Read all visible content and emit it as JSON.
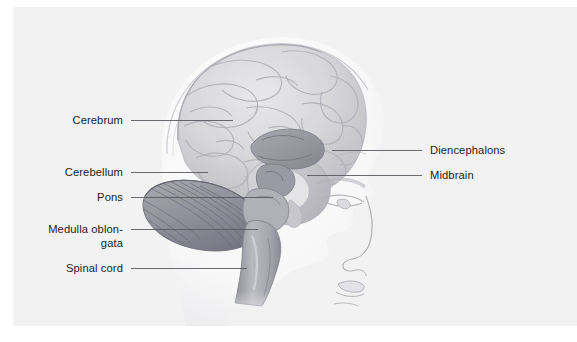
{
  "figure": {
    "subject": "brain",
    "view": "lateral-sagittal-profile",
    "panel_background": "#f2f2f2",
    "page_background": "#ffffff",
    "leader_line_color": "#5a5a62",
    "label_text_color": "#1d1d1d"
  },
  "labels": {
    "left": [
      {
        "id": "cerebrum",
        "text": "Cerebrum",
        "text_x": 123,
        "text_y": 113,
        "line_y": 120,
        "line_x1": 131,
        "line_x2": 233
      },
      {
        "id": "cerebellum",
        "text": "Cerebellum",
        "text_x": 123,
        "text_y": 165,
        "line_y": 172,
        "line_x1": 131,
        "line_x2": 208
      },
      {
        "id": "pons",
        "text": "Pons",
        "text_x": 123,
        "text_y": 190,
        "line_y": 197,
        "line_x1": 131,
        "line_x2": 273
      },
      {
        "id": "medulla",
        "text": "Medulla oblon-",
        "text_x": 123,
        "text_y": 222,
        "line_y": 229,
        "line_x1": 131,
        "line_x2": 258,
        "text2": "gata",
        "text2_y": 236
      },
      {
        "id": "spinal-cord",
        "text": "Spinal cord",
        "text_x": 123,
        "text_y": 261,
        "line_y": 268,
        "line_x1": 131,
        "line_x2": 247
      }
    ],
    "right": [
      {
        "id": "diencephalons",
        "text": "Diencephalons",
        "text_x": 430,
        "text_y": 143,
        "line_y": 150,
        "line_x1": 332,
        "line_x2": 422
      },
      {
        "id": "midbrain",
        "text": "Midbrain",
        "text_x": 430,
        "text_y": 168,
        "line_y": 175,
        "line_x1": 307,
        "line_x2": 422
      }
    ]
  },
  "anatomy": {
    "skull_outline_color": "#c9c9cf",
    "cerebrum_fill": "#d6d6d8",
    "cerebrum_shade": "#b4b4b8",
    "cerebellum_fill": "#9b9ba4",
    "cerebellum_shade": "#7e7e89",
    "brainstem_fill": "#aeaeb6",
    "diencephalon_fill": "#9fa0a9",
    "face_line_color": "#b3b3b8"
  }
}
